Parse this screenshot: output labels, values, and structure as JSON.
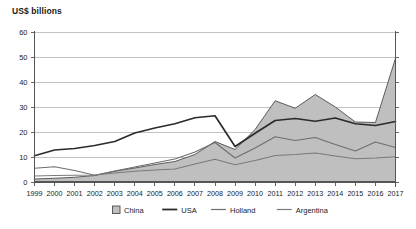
{
  "chart_data": {
    "type": "area",
    "title": "US$ billions",
    "xlabel": "",
    "ylabel": "US$ billions",
    "ylim": [
      0,
      60
    ],
    "yticks": [
      0,
      10,
      20,
      30,
      40,
      50,
      60
    ],
    "grid": true,
    "legend_position": "bottom",
    "x": [
      1999,
      2000,
      2001,
      2002,
      2003,
      2004,
      2005,
      2006,
      2007,
      2008,
      2009,
      2010,
      2011,
      2012,
      2013,
      2014,
      2015,
      2016,
      2017
    ],
    "categories": [
      "1999",
      "2000",
      "2001",
      "2002",
      "2003",
      "2004",
      "2005",
      "2006",
      "2007",
      "2008",
      "2009",
      "2010",
      "2011",
      "2012",
      "2013",
      "2014",
      "2015",
      "2016",
      "2017"
    ],
    "series": [
      {
        "name": "China",
        "render": "area",
        "color": "#bfbfbf",
        "edge_color": "#4d4d4d",
        "values": [
          1.2,
          1.5,
          1.9,
          2.6,
          4.3,
          5.6,
          7.0,
          8.2,
          11.0,
          16.2,
          13.0,
          21.0,
          32.5,
          29.5,
          35.0,
          30.0,
          24.0,
          23.8,
          49.5
        ]
      },
      {
        "name": "USA",
        "render": "line",
        "color": "#2b2b2b",
        "values": [
          10.5,
          12.8,
          13.4,
          14.6,
          16.2,
          19.6,
          21.6,
          23.3,
          25.7,
          26.5,
          14.2,
          19.5,
          24.6,
          25.4,
          24.3,
          25.6,
          23.3,
          22.6,
          24.2
        ]
      },
      {
        "name": "Holland",
        "render": "line",
        "color": "#6e6e6e",
        "values": [
          5.5,
          6.1,
          4.6,
          2.7,
          4.4,
          6.0,
          7.6,
          9.2,
          12.0,
          15.8,
          9.6,
          13.6,
          18.1,
          16.6,
          17.8,
          15.0,
          12.4,
          16.0,
          13.8
        ]
      },
      {
        "name": "Argentina",
        "render": "line",
        "color": "#7a7a7a",
        "values": [
          2.4,
          2.6,
          2.7,
          2.8,
          3.6,
          4.3,
          4.8,
          5.2,
          7.2,
          9.1,
          6.9,
          8.6,
          10.6,
          11.0,
          11.6,
          10.4,
          9.3,
          9.6,
          10.1
        ]
      }
    ],
    "legend": [
      {
        "label": "China",
        "marker": "swatch",
        "color": "#bfbfbf",
        "edge_color": "#4d4d4d"
      },
      {
        "label": "USA",
        "marker": "line",
        "color": "#2b2b2b"
      },
      {
        "label": "Holland",
        "marker": "line",
        "color": "#6e6e6e"
      },
      {
        "label": "Argentina",
        "marker": "line",
        "color": "#7a7a7a"
      }
    ]
  }
}
